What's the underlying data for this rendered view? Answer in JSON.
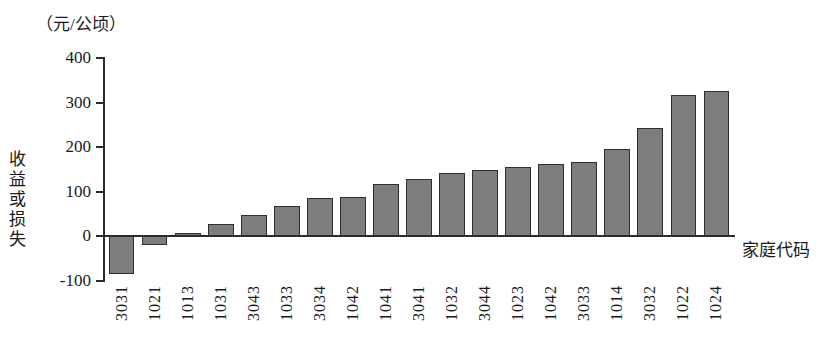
{
  "chart_data": {
    "type": "bar",
    "title": "",
    "unit_label": "（元/公顷）",
    "xlabel": "家庭代码",
    "ylabel": "收益或损失",
    "ylim": [
      -100,
      400
    ],
    "yticks": [
      400,
      300,
      200,
      100,
      0,
      -100
    ],
    "ytick_labels": [
      "400",
      "300",
      "200",
      "100",
      "0",
      "-100"
    ],
    "grid": false,
    "legend": null,
    "bar_color": "#7d7d7d",
    "bar_edge_color": "#2e2e2e",
    "axis_color": "#2b2b2b",
    "categories": [
      "3031",
      "1021",
      "1013",
      "1031",
      "3043",
      "1033",
      "3034",
      "1042",
      "1041",
      "3041",
      "1032",
      "3044",
      "1023",
      "1042",
      "3033",
      "1014",
      "3032",
      "1022",
      "1024"
    ],
    "values": [
      -85,
      -20,
      7,
      28,
      47,
      68,
      85,
      88,
      118,
      128,
      142,
      148,
      155,
      162,
      166,
      196,
      242,
      317,
      325
    ]
  }
}
